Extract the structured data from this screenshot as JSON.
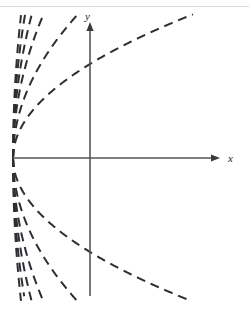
{
  "figure": {
    "title": "",
    "background_color": "#ffffff",
    "width": 249,
    "height": 311,
    "top_rule_color": "#d8d8d8"
  },
  "axes": {
    "x_axis": {
      "label": "x",
      "color": "#55565a",
      "origin_x": 90,
      "origin_y": 158,
      "start_x": 13,
      "end_x": 220,
      "arrow": "right"
    },
    "y_axis": {
      "label": "y",
      "color": "#55565a",
      "top_y": 22,
      "bottom_y": 296,
      "x": 90,
      "arrow": "up"
    },
    "label_positions": {
      "x_label_x": 228,
      "x_label_y": 162,
      "y_label_x": 85,
      "y_label_y": 20
    }
  },
  "chart_data": {
    "type": "line",
    "title": "",
    "xlabel": "x",
    "ylabel": "y",
    "grid": false,
    "legend": null,
    "style": {
      "line_style": "dashed",
      "dash_pattern": "9 6",
      "stroke_color": "#2e2f33",
      "stroke_width": 2.0
    },
    "vertex": {
      "x": 13,
      "y": 158
    },
    "family_form": "y = k * sqrt(x - x0)",
    "x0": 13,
    "series": [
      {
        "name": "k=+1",
        "k": 1.05,
        "side": "upper",
        "end_x": 249,
        "end_y": 124
      },
      {
        "name": "k=+2",
        "k": 1.75,
        "side": "upper",
        "end_x": 249,
        "end_y": 75
      },
      {
        "name": "k=+3",
        "k": 2.55,
        "side": "upper",
        "end_x": 222,
        "end_y": 16
      },
      {
        "name": "k=+4",
        "k": 3.25,
        "side": "upper",
        "end_x": 178,
        "end_y": 16
      },
      {
        "name": "k=+5",
        "k": 4.05,
        "side": "upper",
        "end_x": 152,
        "end_y": 16
      },
      {
        "name": "k=+6",
        "k": 4.95,
        "side": "upper",
        "end_x": 130,
        "end_y": 16
      },
      {
        "name": "k=-1",
        "k": -1.05,
        "side": "lower",
        "end_x": 249,
        "end_y": 192
      },
      {
        "name": "k=-2",
        "k": -1.75,
        "side": "lower",
        "end_x": 249,
        "end_y": 241
      },
      {
        "name": "k=-3",
        "k": -2.55,
        "side": "lower",
        "end_x": 222,
        "end_y": 300
      },
      {
        "name": "k=-4",
        "k": -3.25,
        "side": "lower",
        "end_x": 178,
        "end_y": 300
      },
      {
        "name": "k=-5",
        "k": -4.05,
        "side": "lower",
        "end_x": 152,
        "end_y": 300
      },
      {
        "name": "k=-6",
        "k": -4.95,
        "side": "lower",
        "end_x": 130,
        "end_y": 300
      }
    ],
    "x": [],
    "values": []
  }
}
